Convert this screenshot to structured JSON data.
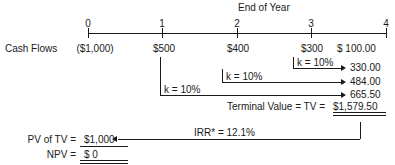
{
  "figure": {
    "title": "End of Year",
    "timeline": {
      "tick_labels": [
        "0",
        "1",
        "2",
        "3",
        "4"
      ],
      "axis_start_px": 88,
      "axis_end_px": 386
    },
    "cash_flow_row": {
      "label": "Cash Flows",
      "values": [
        "($1,000)",
        "$500",
        "$400",
        "$300",
        "$  100.00"
      ]
    },
    "compounding": [
      {
        "rate_label": "k = 10%",
        "future_value": "330.00",
        "from_year": 3
      },
      {
        "rate_label": "k = 10%",
        "future_value": "484.00",
        "from_year": 2
      },
      {
        "rate_label": "k = 10%",
        "future_value": "665.50",
        "from_year": 1
      }
    ],
    "terminal_value": {
      "text": "Terminal Value  =  TV  =",
      "amount": "$1,579.50"
    },
    "irr": {
      "label": "IRR* = 12.1%"
    },
    "results": [
      {
        "label": "PV of TV  =",
        "value": "$1,000",
        "underline": "single"
      },
      {
        "label": "NPV  =",
        "value": "$        0",
        "underline": "double"
      }
    ],
    "colors": {
      "ink": "#1a1a1a",
      "background": "#ffffff"
    }
  }
}
